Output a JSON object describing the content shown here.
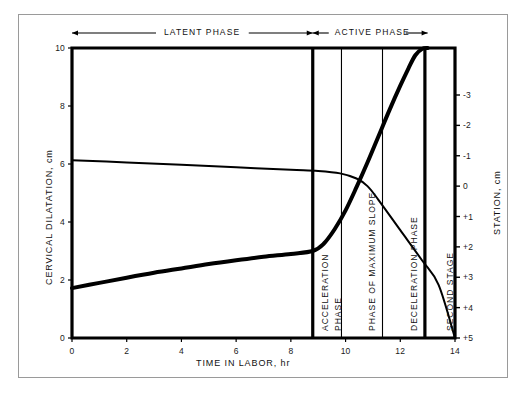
{
  "chart_data": {
    "type": "line",
    "title": "",
    "xlabel": "TIME IN LABOR, hr",
    "ylabel": "CERVICAL DILATATION, cm",
    "y2label": "STATION, cm",
    "xlim": [
      0,
      14
    ],
    "ylim": [
      0,
      10
    ],
    "y2lim": [
      -3.8,
      5.0
    ],
    "grid": false,
    "legend": "none",
    "xticks": [
      "0",
      "2",
      "4",
      "6",
      "8",
      "10",
      "12",
      "14"
    ],
    "xtick_values": [
      0,
      2,
      4,
      6,
      8,
      10,
      12,
      14
    ],
    "yticks": [
      "0",
      "2",
      "4",
      "6",
      "8",
      "10"
    ],
    "ytick_values": [
      0,
      2,
      4,
      6,
      8,
      10
    ],
    "y2ticks": [
      "-3",
      "-2",
      "-1",
      "0",
      "+1",
      "+2",
      "+3",
      "+4",
      "+5"
    ],
    "y2tick_values": [
      -3,
      -2,
      -1,
      0,
      1,
      2,
      3,
      4,
      5
    ],
    "series": [
      {
        "name": "Cervical dilatation",
        "axis": "left",
        "points": [
          [
            0.0,
            1.72
          ],
          [
            1.0,
            1.9
          ],
          [
            2.0,
            2.08
          ],
          [
            3.0,
            2.25
          ],
          [
            4.0,
            2.4
          ],
          [
            5.0,
            2.55
          ],
          [
            6.0,
            2.68
          ],
          [
            7.0,
            2.8
          ],
          [
            8.0,
            2.9
          ],
          [
            8.8,
            3.0
          ],
          [
            9.2,
            3.25
          ],
          [
            9.6,
            3.75
          ],
          [
            10.0,
            4.4
          ],
          [
            10.4,
            5.2
          ],
          [
            10.8,
            6.05
          ],
          [
            11.2,
            6.95
          ],
          [
            11.6,
            7.85
          ],
          [
            12.0,
            8.7
          ],
          [
            12.3,
            9.3
          ],
          [
            12.55,
            9.75
          ],
          [
            12.8,
            9.97
          ],
          [
            13.0,
            10.0
          ]
        ]
      },
      {
        "name": "Fetal station (descent)",
        "axis": "right",
        "points": [
          [
            0.0,
            -0.85
          ],
          [
            2.0,
            -0.78
          ],
          [
            4.0,
            -0.7
          ],
          [
            6.0,
            -0.62
          ],
          [
            8.0,
            -0.54
          ],
          [
            9.0,
            -0.5
          ],
          [
            9.8,
            -0.42
          ],
          [
            10.4,
            -0.25
          ],
          [
            10.8,
            0.0
          ],
          [
            11.2,
            0.45
          ],
          [
            12.0,
            1.45
          ],
          [
            12.8,
            2.45
          ],
          [
            13.4,
            3.25
          ],
          [
            14.0,
            5.0
          ]
        ]
      }
    ],
    "phase_headers": [
      {
        "label": "LATENT PHASE",
        "x_start": 0,
        "x_end": 8.8,
        "arrows": "both"
      },
      {
        "label": "ACTIVE PHASE",
        "x_start": 8.8,
        "x_end": 13.0,
        "arrows": "both"
      }
    ],
    "phase_bands": [
      {
        "label": "ACCELERATION PHASE",
        "x_start": 8.8,
        "x_end": 9.85,
        "divider": "thick-left"
      },
      {
        "label": "PHASE OF MAXIMUM SLOPE",
        "x_start": 9.85,
        "x_end": 11.35,
        "divider": "thin-left"
      },
      {
        "label": "DECELERATION PHASE",
        "x_start": 11.35,
        "x_end": 12.9,
        "divider": "thin-left"
      },
      {
        "label": "SECOND STAGE",
        "x_start": 12.9,
        "x_end": 14.0,
        "divider": "thick-left"
      }
    ],
    "colors": {
      "line": "#000000",
      "axis": "#000000",
      "frame": "#9a9a9a",
      "background": "#ffffff",
      "text": "#111111"
    }
  }
}
